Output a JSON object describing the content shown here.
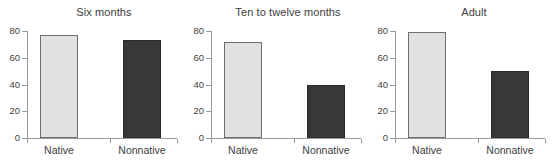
{
  "figure": {
    "background": "#ffffff",
    "bar_colors": {
      "native": "#e1e1e1",
      "nonnative": "#383838",
      "native_edge": "#6e6e6e",
      "nonnative_edge": "#2b2b2b"
    },
    "axis_color": "#9a9a9a",
    "text_color": "#3d3d3d"
  },
  "chart_data": [
    {
      "type": "bar",
      "title": "Six months",
      "categories": [
        "Native",
        "Nonnative"
      ],
      "values": [
        77,
        73
      ],
      "xlabel": "",
      "ylabel": "",
      "ylim": [
        0,
        80
      ],
      "yticks": [
        "0",
        "20",
        "40",
        "60",
        "80"
      ],
      "ytick_values": [
        0,
        20,
        40,
        60,
        80
      ],
      "grid": false,
      "legend": "none"
    },
    {
      "type": "bar",
      "title": "Ten to twelve months",
      "categories": [
        "Native",
        "Nonnative"
      ],
      "values": [
        72,
        40
      ],
      "xlabel": "",
      "ylabel": "",
      "ylim": [
        0,
        80
      ],
      "yticks": [
        "0",
        "20",
        "40",
        "60",
        "80"
      ],
      "ytick_values": [
        0,
        20,
        40,
        60,
        80
      ],
      "grid": false,
      "legend": "none"
    },
    {
      "type": "bar",
      "title": "Adult",
      "categories": [
        "Native",
        "Nonnative"
      ],
      "values": [
        79,
        50
      ],
      "xlabel": "",
      "ylabel": "",
      "ylim": [
        0,
        80
      ],
      "yticks": [
        "0",
        "20",
        "40",
        "60",
        "80"
      ],
      "ytick_values": [
        0,
        20,
        40,
        60,
        80
      ],
      "grid": false,
      "legend": "none"
    }
  ]
}
